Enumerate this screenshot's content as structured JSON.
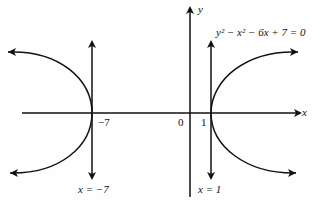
{
  "diagram": {
    "equation": "y² − x² − 6x + 7 = 0",
    "axes": {
      "x_label": "x",
      "y_label": "y",
      "origin_label": "0"
    },
    "ticks": {
      "left": "−7",
      "right": "1"
    },
    "asymptote_lines": {
      "left": "x = −7",
      "right": "x = 1"
    }
  }
}
